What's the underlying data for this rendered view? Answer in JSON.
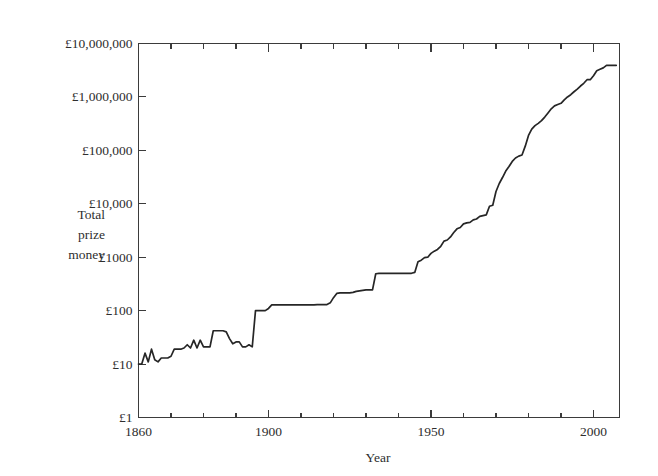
{
  "figure": {
    "background_color": "#ffffff",
    "line_color": "#262626",
    "axis_color": "#3b3b3b"
  },
  "axis_titles": {
    "x": "Year",
    "y_line1": "Total",
    "y_line2": "prize",
    "y_line3": "money"
  },
  "chart_data": {
    "type": "line",
    "title": "",
    "subtitle": "",
    "xlabel": "Year",
    "ylabel": "Total prize money",
    "y_scale": "log",
    "x_scale": "linear",
    "xlim": [
      1860,
      2008
    ],
    "ylim": [
      1,
      10000000
    ],
    "grid": false,
    "legend": null,
    "annotations": [],
    "y_tick_labels": [
      "£1",
      "£10",
      "£100",
      "£1000",
      "£10,000",
      "£100,000",
      "£1,000,000",
      "£10,000,000"
    ],
    "y_tick_values": [
      1,
      10,
      100,
      1000,
      10000,
      100000,
      1000000,
      10000000
    ],
    "x_tick_labels": [
      "1860",
      "1900",
      "1950",
      "2000"
    ],
    "x_tick_values": [
      1860,
      1900,
      1950,
      2000
    ],
    "x_minor_tick_values": [
      1870,
      1880,
      1890,
      1910,
      1920,
      1930,
      1940,
      1960,
      1970,
      1980,
      1990
    ],
    "series": [
      {
        "name": "Total prize money",
        "x": [
          1860,
          1861,
          1862,
          1863,
          1864,
          1865,
          1866,
          1867,
          1868,
          1869,
          1870,
          1871,
          1872,
          1873,
          1874,
          1875,
          1876,
          1877,
          1878,
          1879,
          1880,
          1881,
          1882,
          1883,
          1884,
          1885,
          1886,
          1887,
          1888,
          1889,
          1890,
          1891,
          1892,
          1893,
          1894,
          1895,
          1896,
          1897,
          1898,
          1899,
          1900,
          1901,
          1902,
          1903,
          1904,
          1905,
          1906,
          1907,
          1908,
          1909,
          1910,
          1911,
          1912,
          1913,
          1914,
          1915,
          1916,
          1917,
          1918,
          1919,
          1920,
          1921,
          1922,
          1923,
          1924,
          1925,
          1926,
          1927,
          1928,
          1929,
          1930,
          1931,
          1932,
          1933,
          1934,
          1935,
          1936,
          1937,
          1938,
          1939,
          1940,
          1941,
          1942,
          1943,
          1944,
          1945,
          1946,
          1947,
          1948,
          1949,
          1950,
          1951,
          1952,
          1953,
          1954,
          1955,
          1956,
          1957,
          1958,
          1959,
          1960,
          1961,
          1962,
          1963,
          1964,
          1965,
          1966,
          1967,
          1968,
          1969,
          1970,
          1971,
          1972,
          1973,
          1974,
          1975,
          1976,
          1977,
          1978,
          1979,
          1980,
          1981,
          1982,
          1983,
          1984,
          1985,
          1986,
          1987,
          1988,
          1989,
          1990,
          1991,
          1992,
          1993,
          1994,
          1995,
          1996,
          1997,
          1998,
          1999,
          2000,
          2001,
          2002,
          2003,
          2004,
          2005,
          2006,
          2007
        ],
        "values": [
          10,
          10,
          16,
          11,
          19,
          12,
          11,
          13,
          13,
          13,
          14,
          19,
          19,
          19,
          20,
          23,
          20,
          28,
          20,
          28,
          21,
          21,
          21,
          42,
          42,
          42,
          42,
          40,
          30,
          24,
          26,
          26,
          21,
          21,
          23,
          21,
          100,
          100,
          100,
          100,
          110,
          128,
          128,
          128,
          128,
          128,
          128,
          128,
          128,
          128,
          128,
          128,
          128,
          128,
          128,
          130,
          130,
          130,
          130,
          140,
          175,
          210,
          215,
          215,
          215,
          215,
          220,
          230,
          235,
          240,
          245,
          245,
          245,
          490,
          500,
          500,
          500,
          500,
          500,
          500,
          500,
          500,
          500,
          500,
          500,
          520,
          820,
          880,
          980,
          1000,
          1180,
          1300,
          1400,
          1600,
          2000,
          2100,
          2400,
          2900,
          3400,
          3600,
          4200,
          4400,
          4500,
          5000,
          5200,
          5800,
          6000,
          6200,
          9000,
          9400,
          17000,
          24000,
          31000,
          41000,
          50000,
          62000,
          72000,
          78000,
          82000,
          120000,
          190000,
          250000,
          290000,
          320000,
          360000,
          420000,
          500000,
          600000,
          680000,
          720000,
          760000,
          880000,
          1000000,
          1100000,
          1250000,
          1400000,
          1600000,
          1800000,
          2100000,
          2100000,
          2500000,
          3100000,
          3300000,
          3500000,
          3900000,
          3900000,
          3900000,
          3900000
        ]
      }
    ]
  }
}
